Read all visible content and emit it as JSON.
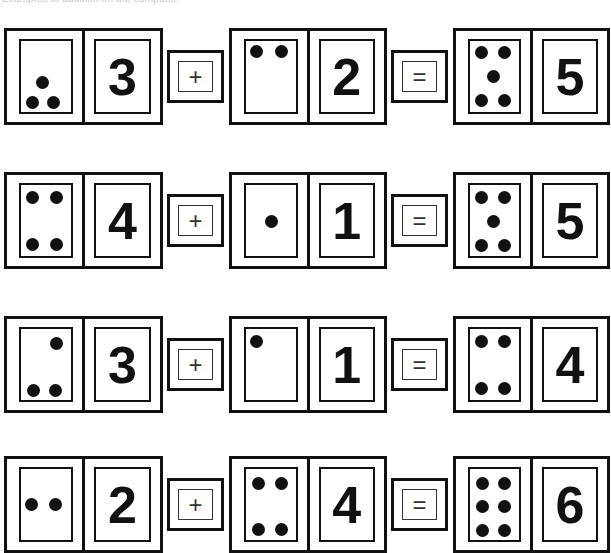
{
  "caption": "Examples of addition on the computer.",
  "equations": [
    {
      "a": {
        "dots": 3,
        "numeral": "3",
        "layout": "tri-low"
      },
      "operator": "+",
      "b": {
        "dots": 2,
        "numeral": "2",
        "layout": "two-top"
      },
      "equals": "=",
      "result": {
        "dots": 5,
        "numeral": "5",
        "layout": "five"
      }
    },
    {
      "a": {
        "dots": 4,
        "numeral": "4",
        "layout": "four"
      },
      "operator": "+",
      "b": {
        "dots": 1,
        "numeral": "1",
        "layout": "one-center"
      },
      "equals": "=",
      "result": {
        "dots": 5,
        "numeral": "5",
        "layout": "five"
      }
    },
    {
      "a": {
        "dots": 3,
        "numeral": "3",
        "layout": "three-diag"
      },
      "operator": "+",
      "b": {
        "dots": 1,
        "numeral": "1",
        "layout": "one-topleft"
      },
      "equals": "=",
      "result": {
        "dots": 4,
        "numeral": "4",
        "layout": "four"
      }
    },
    {
      "a": {
        "dots": 2,
        "numeral": "2",
        "layout": "two-middle"
      },
      "operator": "+",
      "b": {
        "dots": 4,
        "numeral": "4",
        "layout": "four"
      },
      "equals": "=",
      "result": {
        "dots": 6,
        "numeral": "6",
        "layout": "six"
      }
    }
  ]
}
